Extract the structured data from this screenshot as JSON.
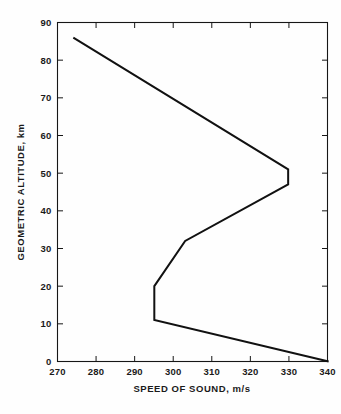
{
  "chart_data": {
    "type": "line",
    "title": "",
    "xlabel": "SPEED OF SOUND, m/s",
    "ylabel": "GEOMETRIC ALTITUDE, km",
    "xlim": [
      270,
      340
    ],
    "ylim": [
      0,
      90
    ],
    "xticks": [
      270,
      280,
      290,
      300,
      310,
      320,
      330,
      340
    ],
    "yticks": [
      0,
      10,
      20,
      30,
      40,
      50,
      60,
      70,
      80,
      90
    ],
    "xtick_labels": [
      "270",
      "280",
      "290",
      "300",
      "310",
      "320",
      "330",
      "340"
    ],
    "ytick_labels": [
      "0",
      "10",
      "20",
      "30",
      "40",
      "50",
      "60",
      "70",
      "80",
      "90"
    ],
    "grid": false,
    "legend": null,
    "series": [
      {
        "name": "U.S. Standard Atmosphere speed of sound",
        "x_key": "speed_of_sound_m_s",
        "y_key": "altitude_km",
        "points": [
          {
            "speed_of_sound_m_s": 340.3,
            "altitude_km": 0.0
          },
          {
            "speed_of_sound_m_s": 295.1,
            "altitude_km": 11.0
          },
          {
            "speed_of_sound_m_s": 295.1,
            "altitude_km": 20.0
          },
          {
            "speed_of_sound_m_s": 303.1,
            "altitude_km": 32.0
          },
          {
            "speed_of_sound_m_s": 329.8,
            "altitude_km": 47.0
          },
          {
            "speed_of_sound_m_s": 329.8,
            "altitude_km": 51.0
          },
          {
            "speed_of_sound_m_s": 274.1,
            "altitude_km": 86.0
          }
        ]
      }
    ],
    "annotations": []
  },
  "axes": {
    "x_title": "SPEED OF SOUND, m/s",
    "y_title": "GEOMETRIC ALTITUDE, km"
  },
  "tick_text": {
    "x": [
      "270",
      "280",
      "290",
      "300",
      "310",
      "320",
      "330",
      "340"
    ],
    "y": [
      "0",
      "10",
      "20",
      "30",
      "40",
      "50",
      "60",
      "70",
      "80",
      "90"
    ]
  },
  "colors": {
    "line": "#111111",
    "axis": "#161616",
    "text": "#1a1a1a",
    "background": "#fefefe"
  }
}
